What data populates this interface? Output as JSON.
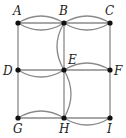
{
  "diagram": {
    "type": "multigraph",
    "colors": {
      "edge": "#8a8a8a",
      "node": "#111111",
      "label": "#222222",
      "background": "#ffffff"
    },
    "nodes": [
      {
        "id": "A",
        "label": "A",
        "x": 18,
        "y": 23,
        "lx": 13,
        "ly": 15
      },
      {
        "id": "B",
        "label": "B",
        "x": 64,
        "y": 23,
        "lx": 59,
        "ly": 15
      },
      {
        "id": "C",
        "label": "C",
        "x": 110,
        "y": 23,
        "lx": 105,
        "ly": 15
      },
      {
        "id": "D",
        "label": "D",
        "x": 18,
        "y": 70,
        "lx": 3,
        "ly": 75
      },
      {
        "id": "E",
        "label": "E",
        "x": 64,
        "y": 70,
        "lx": 68,
        "ly": 64
      },
      {
        "id": "F",
        "label": "F",
        "x": 110,
        "y": 70,
        "lx": 114,
        "ly": 75
      },
      {
        "id": "G",
        "label": "G",
        "x": 18,
        "y": 118,
        "lx": 13,
        "ly": 133
      },
      {
        "id": "H",
        "label": "H",
        "x": 64,
        "y": 118,
        "lx": 59,
        "ly": 133
      },
      {
        "id": "I",
        "label": "I",
        "x": 110,
        "y": 118,
        "lx": 107,
        "ly": 133
      }
    ],
    "edges": [
      {
        "from": "A",
        "to": "B",
        "kind": "straight"
      },
      {
        "from": "A",
        "to": "B",
        "kind": "curve",
        "bulge": "up"
      },
      {
        "from": "A",
        "to": "B",
        "kind": "curve",
        "bulge": "down"
      },
      {
        "from": "B",
        "to": "C",
        "kind": "straight"
      },
      {
        "from": "B",
        "to": "C",
        "kind": "curve",
        "bulge": "up"
      },
      {
        "from": "B",
        "to": "C",
        "kind": "curve",
        "bulge": "down"
      },
      {
        "from": "A",
        "to": "D",
        "kind": "straight"
      },
      {
        "from": "C",
        "to": "F",
        "kind": "straight"
      },
      {
        "from": "B",
        "to": "E",
        "kind": "straight"
      },
      {
        "from": "B",
        "to": "E",
        "kind": "curve",
        "bulge": "left"
      },
      {
        "from": "D",
        "to": "E",
        "kind": "straight"
      },
      {
        "from": "D",
        "to": "E",
        "kind": "curve",
        "bulge": "down"
      },
      {
        "from": "E",
        "to": "F",
        "kind": "straight"
      },
      {
        "from": "E",
        "to": "F",
        "kind": "curve",
        "bulge": "up"
      },
      {
        "from": "E",
        "to": "H",
        "kind": "straight"
      },
      {
        "from": "E",
        "to": "H",
        "kind": "curve",
        "bulge": "right"
      },
      {
        "from": "D",
        "to": "G",
        "kind": "straight"
      },
      {
        "from": "F",
        "to": "I",
        "kind": "straight"
      },
      {
        "from": "G",
        "to": "H",
        "kind": "straight"
      },
      {
        "from": "G",
        "to": "H",
        "kind": "curve",
        "bulge": "up"
      },
      {
        "from": "H",
        "to": "I",
        "kind": "straight"
      },
      {
        "from": "H",
        "to": "I",
        "kind": "curve",
        "bulge": "down"
      }
    ]
  }
}
